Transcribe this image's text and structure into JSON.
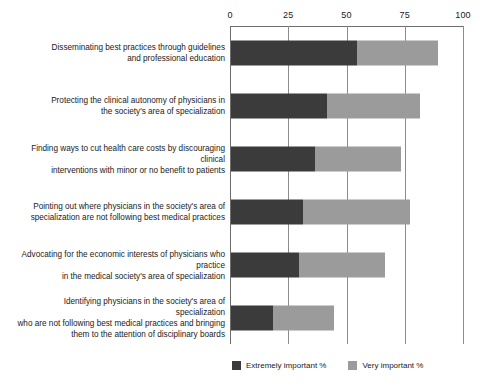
{
  "chart_data": {
    "type": "bar",
    "orientation": "horizontal",
    "stacked": true,
    "title": "",
    "xlabel": "",
    "ylabel": "",
    "xlim": [
      0,
      100
    ],
    "grid": true,
    "legend_position": "bottom-right",
    "ticks": [
      "0",
      "25",
      "50",
      "75",
      "100"
    ],
    "tick_values": [
      0,
      25,
      50,
      75,
      100
    ],
    "legend": [
      {
        "name": "Extremely important %",
        "color": "#3b3b3b"
      },
      {
        "name": "Very important %",
        "color": "#9b9b9b"
      }
    ],
    "categories": [
      "Disseminating best practices through guidelines and professional education",
      "Protecting the clinical autonomy of physicians in the society's area of  specialization",
      "Finding ways to cut health care costs by discouraging clinical interventions with minor or no benefit to patients",
      "Pointing out where physicians in the society's area of specialization are not following best medical practices",
      "Advocating for the economic interests of physicians who practice in the medical society's area of specialization",
      "Identifying physicians in the society's area of specialization who are not following best medical practices and bringing them to the attention of disciplinary boards"
    ],
    "category_lines": [
      [
        "Disseminating best practices through guidelines",
        "and professional education"
      ],
      [
        "Protecting the clinical autonomy of physicians in",
        "the society's area of  specialization"
      ],
      [
        "Finding ways to cut health care costs by discouraging clinical",
        "interventions with minor or no benefit to patients"
      ],
      [
        "Pointing out where physicians in the society's area of",
        "specialization are not following best medical practices"
      ],
      [
        "Advocating for the economic interests of physicians who practice",
        "in the medical society's area of specialization"
      ],
      [
        "Identifying physicians in the society's area of specialization",
        "who are not following best medical practices and bringing",
        "them to the attention of disciplinary boards"
      ]
    ],
    "series": [
      {
        "name": "Extremely important %",
        "color": "#3b3b3b",
        "values": [
          54,
          41,
          36,
          31,
          29,
          18
        ]
      },
      {
        "name": "Very important %",
        "color": "#9b9b9b",
        "values": [
          35,
          40,
          37,
          46,
          37,
          26
        ]
      }
    ],
    "totals": [
      89,
      81,
      73,
      77,
      66,
      44
    ]
  },
  "footnote": ""
}
